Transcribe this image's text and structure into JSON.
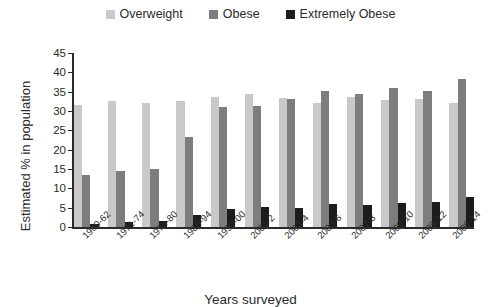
{
  "chart_data": {
    "type": "bar",
    "title": "",
    "xlabel": "Years surveyed",
    "ylabel": "Estimated % in population",
    "ylim": [
      0,
      45
    ],
    "yticks": [
      45,
      40,
      35,
      30,
      25,
      20,
      15,
      10,
      5,
      0
    ],
    "grid": false,
    "legend_position": "top-center",
    "categories": [
      "1960-62",
      "1971-74",
      "1976-80",
      "1988-94",
      "1999-00",
      "2001-2",
      "2003-4",
      "2005-6",
      "2007-8",
      "2009-10",
      "2009-12",
      "2009-14"
    ],
    "series": [
      {
        "name": "Overweight",
        "color": "#c9c9c9",
        "values": [
          31.5,
          32.7,
          32.1,
          32.7,
          33.6,
          34.4,
          33.4,
          32.2,
          33.6,
          32.8,
          33.2,
          32.1
        ]
      },
      {
        "name": "Obese",
        "color": "#7d7d7d",
        "values": [
          13.4,
          14.6,
          15.1,
          23.4,
          31.0,
          31.3,
          33.0,
          35.1,
          34.5,
          35.9,
          35.2,
          38.2
        ]
      },
      {
        "name": "Extremely Obese",
        "color": "#1c1c1c",
        "values": [
          0.9,
          1.4,
          1.5,
          3.0,
          4.7,
          5.1,
          4.8,
          5.9,
          5.7,
          6.3,
          6.4,
          7.7
        ]
      }
    ]
  },
  "legend": {
    "items": [
      {
        "label": "Overweight",
        "color": "#c9c9c9"
      },
      {
        "label": "Obese",
        "color": "#7d7d7d"
      },
      {
        "label": "Extremely Obese",
        "color": "#1c1c1c"
      }
    ]
  }
}
